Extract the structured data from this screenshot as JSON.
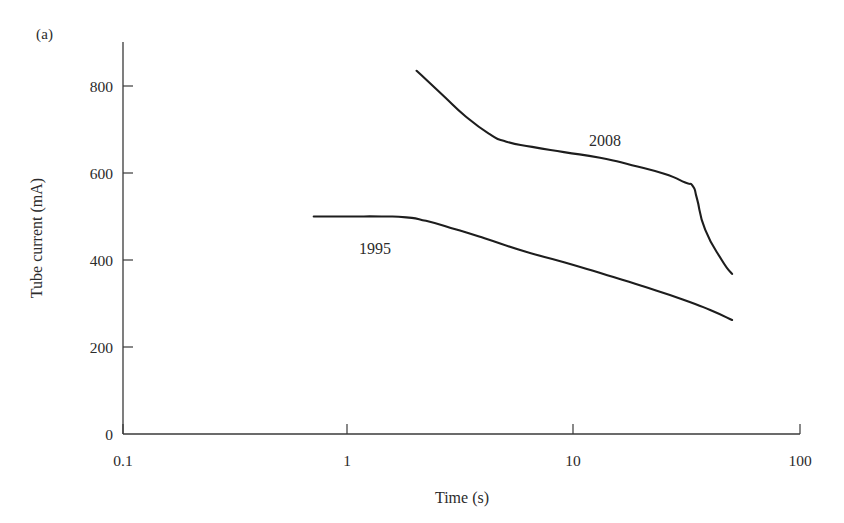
{
  "figure": {
    "panel_label": "(a)",
    "background_color": "#ffffff",
    "line_color": "#1d1d1d",
    "text_color": "#2b2b2b"
  },
  "chart_data": {
    "type": "line",
    "title": "",
    "subtitle": "",
    "panel": "(a)",
    "xlabel": "Time (s)",
    "ylabel": "Tube current (mA)",
    "xscale": "log",
    "yscale": "linear",
    "xlim": [
      0.1,
      100
    ],
    "ylim": [
      0,
      900
    ],
    "xticks": [
      0.1,
      1,
      10,
      100
    ],
    "xticklabels": [
      "0.1",
      "1",
      "10",
      "100"
    ],
    "yticks": [
      0,
      200,
      400,
      600,
      800
    ],
    "yticklabels": [
      "0",
      "200",
      "400",
      "600",
      "800"
    ],
    "grid": false,
    "legend": "inline-annotations",
    "annotations": [
      {
        "text": "2008",
        "x": 14,
        "y": 710
      },
      {
        "text": "1995",
        "x": 2.6,
        "y": 440
      }
    ],
    "series": [
      {
        "name": "2008",
        "label": "2008",
        "color": "#1d1d1d",
        "x": [
          2.0,
          2.6,
          3.3,
          4.2,
          5.0,
          6.5,
          9.0,
          13.0,
          18.0,
          25.0,
          31.0,
          33.5,
          35.0,
          38.0,
          45.0,
          50.0
        ],
        "y": [
          835,
          780,
          730,
          690,
          672,
          660,
          648,
          635,
          618,
          598,
          578,
          570,
          540,
          470,
          400,
          368
        ]
      },
      {
        "name": "1995",
        "label": "1995",
        "color": "#1d1d1d",
        "x": [
          0.7,
          1.0,
          1.4,
          1.8,
          2.2,
          3.0,
          4.0,
          6.0,
          9.0,
          14.0,
          20.0,
          30.0,
          40.0,
          50.0
        ],
        "y": [
          500,
          500,
          500,
          498,
          490,
          470,
          450,
          420,
          395,
          365,
          340,
          310,
          285,
          262
        ]
      }
    ]
  },
  "axes": {
    "y_axis_title": "Tube current (mA)",
    "x_axis_title": "Time (s)",
    "y_tick_labels": [
      "800",
      "600",
      "400",
      "200",
      "0"
    ],
    "x_tick_labels": [
      "0.1",
      "1",
      "10",
      "100"
    ]
  },
  "series_labels": {
    "newer": "2008",
    "older": "1995"
  }
}
